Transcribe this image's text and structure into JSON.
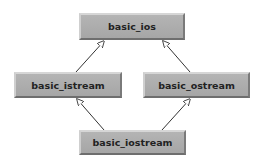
{
  "diagram": {
    "type": "class-inheritance",
    "colors": {
      "node_fill": "#ababab",
      "node_highlight": "#d6d6d6",
      "node_shadow": "#6e6e6e",
      "text": "#222222",
      "edge": "#333333",
      "background": "#ffffff"
    },
    "nodes": [
      {
        "id": "basic_ios",
        "label": "basic_ios"
      },
      {
        "id": "basic_istream",
        "label": "basic_istream"
      },
      {
        "id": "basic_ostream",
        "label": "basic_ostream"
      },
      {
        "id": "basic_iostream",
        "label": "basic_iostream"
      }
    ],
    "edges": [
      {
        "from": "basic_istream",
        "to": "basic_ios",
        "arrow": "hollow-triangle"
      },
      {
        "from": "basic_ostream",
        "to": "basic_ios",
        "arrow": "hollow-triangle"
      },
      {
        "from": "basic_iostream",
        "to": "basic_istream",
        "arrow": "hollow-triangle"
      },
      {
        "from": "basic_iostream",
        "to": "basic_ostream",
        "arrow": "hollow-triangle"
      }
    ]
  }
}
